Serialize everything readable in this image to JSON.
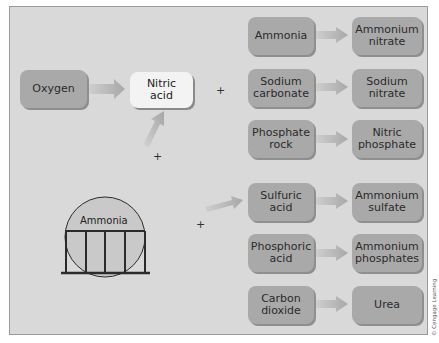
{
  "diagram": {
    "sources": {
      "oxygen": "Oxygen",
      "nitric_acid": "Nitric\nacid",
      "ammonia_tank": "Ammonia"
    },
    "operators": [
      "+",
      "+",
      "+"
    ],
    "reactions": [
      {
        "reactant": "Ammonia",
        "product": "Ammonium\nnitrate"
      },
      {
        "reactant": "Sodium\ncarbonate",
        "product": "Sodium\nnitrate"
      },
      {
        "reactant": "Phosphate\nrock",
        "product": "Nitric\nphosphate"
      },
      {
        "reactant": "Sulfuric acid",
        "product": "Ammonium\nsulfate"
      },
      {
        "reactant": "Phosphoric\nacid",
        "product": "Ammonium\nphosphates"
      },
      {
        "reactant": "Carbon\ndioxide",
        "product": "Urea"
      }
    ],
    "credit": "© Cengage Learning",
    "colors": {
      "background": "#d9d9d9",
      "box_dark": "#a9a9a9",
      "box_light": "#f3f3f3",
      "arrow": "#b5b5b5",
      "line": "#2b2b2b"
    }
  }
}
